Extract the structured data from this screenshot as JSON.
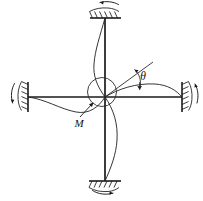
{
  "figure": {
    "type": "structural-mechanics-diagram",
    "background_color": "#ffffff",
    "line_color": "#1a1a1a",
    "curve_color": "#2b2b2b",
    "labels": {
      "moment": "M",
      "rotation_angle": "θ"
    },
    "joint": {
      "name": "rigid-joint",
      "x": 105,
      "y": 97
    },
    "members": [
      {
        "name": "upper-column",
        "direction": "up",
        "x1": 105,
        "y1": 97,
        "x2": 105,
        "y2": 18
      },
      {
        "name": "lower-column",
        "direction": "down",
        "x1": 105,
        "y1": 97,
        "x2": 105,
        "y2": 180
      },
      {
        "name": "left-beam",
        "direction": "left",
        "x1": 105,
        "y1": 97,
        "x2": 28,
        "y2": 97
      },
      {
        "name": "right-beam",
        "direction": "right",
        "x1": 105,
        "y1": 97,
        "x2": 182,
        "y2": 97
      }
    ],
    "supports": [
      {
        "name": "top-fixed-support",
        "position": "top",
        "hatch_side": "above"
      },
      {
        "name": "bottom-fixed-support",
        "position": "bottom",
        "hatch_side": "below"
      },
      {
        "name": "left-fixed-support",
        "position": "left",
        "hatch_side": "left"
      },
      {
        "name": "right-fixed-support",
        "position": "right",
        "hatch_side": "right"
      }
    ],
    "rotation_arrows": [
      {
        "name": "top-support-rotation-arrow"
      },
      {
        "name": "bottom-support-rotation-arrow"
      },
      {
        "name": "left-support-rotation-arrow"
      },
      {
        "name": "right-support-rotation-arrow"
      }
    ],
    "annotations": [
      {
        "name": "moment-annotation",
        "text": "M",
        "x": 77,
        "y": 124
      },
      {
        "name": "theta-annotation",
        "text": "θ",
        "x": 143,
        "y": 77
      }
    ]
  }
}
